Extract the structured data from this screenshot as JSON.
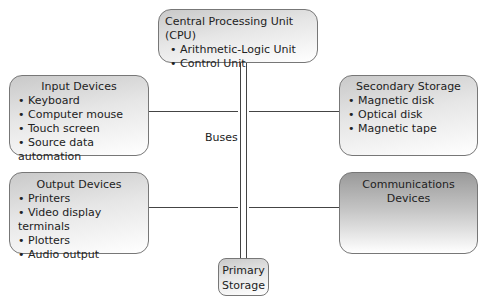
{
  "diagram": {
    "cpu": {
      "title": "Central Processing Unit (CPU)",
      "items": [
        "Arithmetic-Logic Unit",
        "Control Unit"
      ]
    },
    "input": {
      "title": "Input Devices",
      "items": [
        "Keyboard",
        "Computer mouse",
        "Touch screen",
        "Source data automation"
      ]
    },
    "secondary": {
      "title": "Secondary Storage",
      "items": [
        "Magnetic disk",
        "Optical disk",
        "Magnetic tape"
      ]
    },
    "output": {
      "title": "Output Devices",
      "items": [
        "Printers",
        "Video display terminals",
        "Plotters",
        "Audio output"
      ]
    },
    "comms": {
      "title_line1": "Communications",
      "title_line2": "Devices"
    },
    "primary": {
      "title_line1": "Primary",
      "title_line2": "Storage"
    },
    "bus_label": "Buses"
  }
}
